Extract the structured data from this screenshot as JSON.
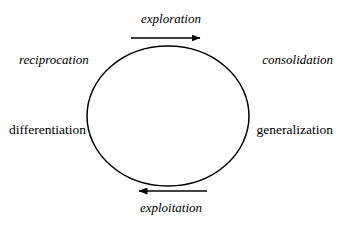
{
  "diagram": {
    "type": "cycle",
    "background_color": "#ffffff",
    "stroke_color": "#000000",
    "circle": {
      "center_x": 168,
      "center_y": 116,
      "radius_x": 81,
      "radius_y": 70
    },
    "arrows": [
      {
        "name": "top-arrow",
        "direction": "right",
        "x1": 131,
        "y1": 38,
        "x2": 207,
        "y2": 38,
        "label": "exploration",
        "label_style": "italic"
      },
      {
        "name": "bottom-arrow",
        "direction": "left",
        "x1": 207,
        "y1": 191,
        "x2": 131,
        "y2": 191,
        "label": "exploitation",
        "label_style": "italic"
      }
    ],
    "labels": {
      "top": "exploration",
      "bottom": "exploitation",
      "top_left": "reciprocation",
      "top_right": "consolidation",
      "left": "differentiation",
      "right": "generalization"
    }
  }
}
